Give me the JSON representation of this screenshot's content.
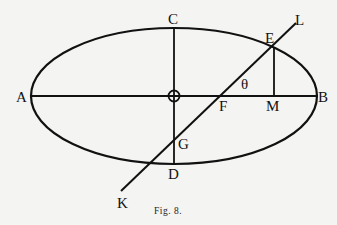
{
  "figure": {
    "caption": "Fig. 8.",
    "ink_color": "#111111",
    "background": "#f4f4f2"
  },
  "labels": {
    "A": "A",
    "B": "B",
    "C": "C",
    "D": "D",
    "E": "E",
    "F": "F",
    "G": "G",
    "K": "K",
    "L": "L",
    "M": "M",
    "theta": "θ"
  },
  "elements": {
    "ellipse": "ellipse ACBD",
    "major_axis": "AB",
    "minor_axis": "CD",
    "secant_line": "KL",
    "perpendicular": "EM",
    "center_marker": "circle at center O"
  }
}
